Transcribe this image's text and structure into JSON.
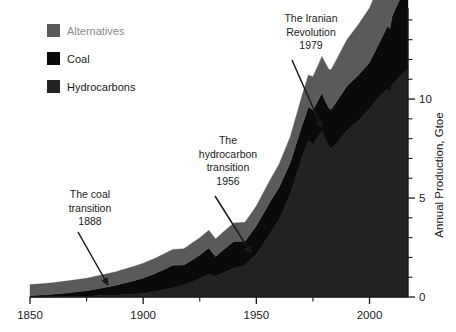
{
  "chart_data": {
    "type": "area",
    "stacked": true,
    "title": "",
    "subtitle": "",
    "xlabel": "",
    "ylabel": "Annual Production, Gtoe",
    "xlim": [
      1850,
      2017
    ],
    "ylim": [
      0,
      14.6
    ],
    "grid": false,
    "legend_position": "top-left",
    "x_major_ticks": [
      1850,
      1900,
      1950,
      2000
    ],
    "x_major_tick_labels": [
      "1850",
      "1900",
      "1950",
      "2000"
    ],
    "x_minor_tick_interval": 25,
    "y_major_ticks": [
      0,
      5,
      10
    ],
    "y_major_tick_labels": [
      "0",
      "5",
      "10"
    ],
    "y_minor_tick_interval": 1,
    "y_axis_side": "right",
    "stack_order_bottom_to_top": [
      "Hydrocarbons",
      "Coal",
      "Alternatives"
    ],
    "x": [
      1850,
      1855,
      1860,
      1865,
      1870,
      1875,
      1880,
      1885,
      1888,
      1890,
      1895,
      1900,
      1905,
      1910,
      1913,
      1918,
      1920,
      1925,
      1929,
      1932,
      1935,
      1940,
      1945,
      1950,
      1956,
      1960,
      1965,
      1970,
      1973,
      1975,
      1979,
      1980,
      1982,
      1983,
      1985,
      1990,
      1992,
      1995,
      2000,
      2005,
      2008,
      2009,
      2010,
      2013,
      2015,
      2017
    ],
    "series": [
      {
        "name": "Hydrocarbons",
        "color": "#222222",
        "values": [
          0.0,
          0.0,
          0.01,
          0.02,
          0.03,
          0.04,
          0.06,
          0.08,
          0.09,
          0.11,
          0.14,
          0.18,
          0.26,
          0.38,
          0.45,
          0.6,
          0.68,
          0.92,
          1.15,
          1.05,
          1.2,
          1.45,
          1.6,
          2.15,
          3.2,
          3.9,
          5.2,
          7.0,
          7.9,
          7.7,
          8.4,
          8.1,
          7.6,
          7.5,
          7.7,
          8.4,
          8.6,
          8.9,
          9.5,
          10.2,
          10.5,
          10.3,
          10.7,
          11.1,
          11.3,
          11.5
        ]
      },
      {
        "name": "Coal",
        "color": "#0a0a0a",
        "values": [
          0.08,
          0.1,
          0.13,
          0.17,
          0.22,
          0.28,
          0.36,
          0.45,
          0.5,
          0.55,
          0.66,
          0.78,
          0.92,
          1.05,
          1.15,
          1.02,
          1.08,
          1.2,
          1.32,
          1.0,
          1.15,
          1.35,
          1.22,
          1.45,
          1.6,
          1.62,
          1.6,
          1.6,
          1.7,
          1.75,
          1.9,
          1.92,
          1.95,
          1.98,
          2.1,
          2.25,
          2.28,
          2.3,
          2.35,
          2.8,
          3.2,
          3.25,
          3.5,
          3.85,
          3.85,
          3.75
        ]
      },
      {
        "name": "Alternatives",
        "color": "#5a5a5a",
        "values": [
          0.55,
          0.57,
          0.58,
          0.6,
          0.62,
          0.63,
          0.65,
          0.67,
          0.68,
          0.69,
          0.71,
          0.74,
          0.76,
          0.79,
          0.8,
          0.82,
          0.84,
          0.87,
          0.9,
          0.88,
          0.9,
          0.94,
          0.95,
          1.0,
          1.1,
          1.18,
          1.3,
          1.5,
          1.62,
          1.68,
          1.85,
          1.9,
          1.95,
          2.0,
          2.1,
          2.35,
          2.42,
          2.55,
          2.75,
          2.95,
          3.1,
          3.15,
          3.3,
          3.55,
          3.7,
          3.85
        ]
      }
    ],
    "legend": [
      {
        "label": "Alternatives",
        "color": "#5a5a5a",
        "text_color": "#8b8b8b"
      },
      {
        "label": "Coal",
        "color": "#0a0a0a",
        "text_color": "#1a1a1a"
      },
      {
        "label": "Hydrocarbons",
        "color": "#222222",
        "text_color": "#1a1a1a"
      }
    ],
    "annotations": [
      {
        "id": "coal-transition",
        "lines": [
          "The coal",
          "transition",
          "1888"
        ],
        "text_x": 90,
        "text_y": 198,
        "arrow_from_x": 78,
        "arrow_from_y": 232,
        "arrow_to_x": 108,
        "arrow_to_y": 285
      },
      {
        "id": "hydrocarbon-transition",
        "lines": [
          "The",
          "hydrocarbon",
          "transition",
          "1956"
        ],
        "text_x": 228,
        "text_y": 144,
        "arrow_from_x": 215,
        "arrow_from_y": 196,
        "arrow_to_x": 251,
        "arrow_to_y": 253
      },
      {
        "id": "iranian-revolution",
        "lines": [
          "The Iranian",
          "Revolution",
          "1979"
        ],
        "text_x": 311,
        "text_y": 22,
        "arrow_from_x": 292,
        "arrow_from_y": 60,
        "arrow_to_x": 322,
        "arrow_to_y": 128
      }
    ]
  },
  "plot": {
    "left_px": 30,
    "right_px": 408,
    "top_px": 8,
    "bottom_px": 297
  }
}
